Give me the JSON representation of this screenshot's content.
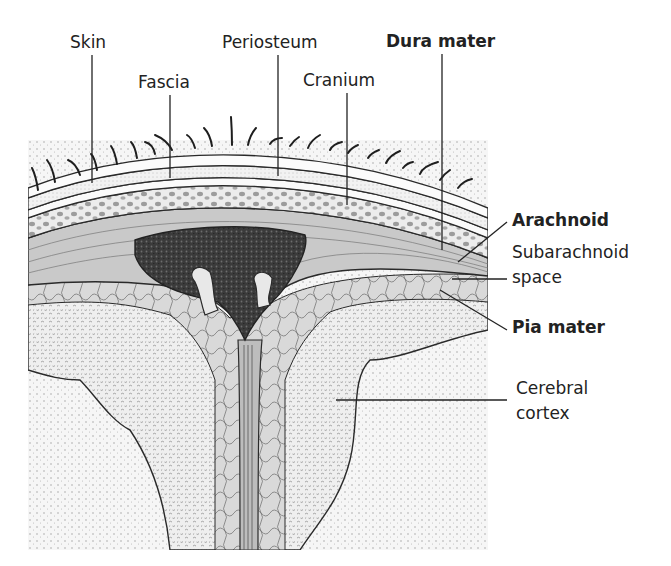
{
  "diagram": {
    "colors": {
      "background": "#ffffff",
      "ink": "#222222",
      "skin_layer": "#f4f4f4",
      "fascia_layer": "#ebebeb",
      "cranium_fill": "#e6e6e6",
      "cranium_dots": "#9a9a9a",
      "dura_fill": "#c8c8c8",
      "sinus_fill": "#3a3a3a",
      "subarachnoid_fill": "#d8d8d8",
      "gray_matter_fill": "#ececec",
      "white_matter_fill": "#f7f7f7"
    },
    "labels": [
      {
        "id": "skin",
        "text": "Skin",
        "bold": false
      },
      {
        "id": "fascia",
        "text": "Fascia",
        "bold": false
      },
      {
        "id": "periosteum",
        "text": "Periosteum",
        "bold": false
      },
      {
        "id": "cranium",
        "text": "Cranium",
        "bold": false
      },
      {
        "id": "dura_mater",
        "text": "Dura mater",
        "bold": true
      },
      {
        "id": "arachnoid",
        "text": "Arachnoid",
        "bold": true
      },
      {
        "id": "subarachnoid_1",
        "text": "Subarachnoid",
        "bold": false
      },
      {
        "id": "subarachnoid_2",
        "text": "space",
        "bold": false
      },
      {
        "id": "pia_mater",
        "text": "Pia mater",
        "bold": true
      },
      {
        "id": "cerebral_1",
        "text": "Cerebral",
        "bold": false
      },
      {
        "id": "cerebral_2",
        "text": "cortex",
        "bold": false
      }
    ]
  }
}
